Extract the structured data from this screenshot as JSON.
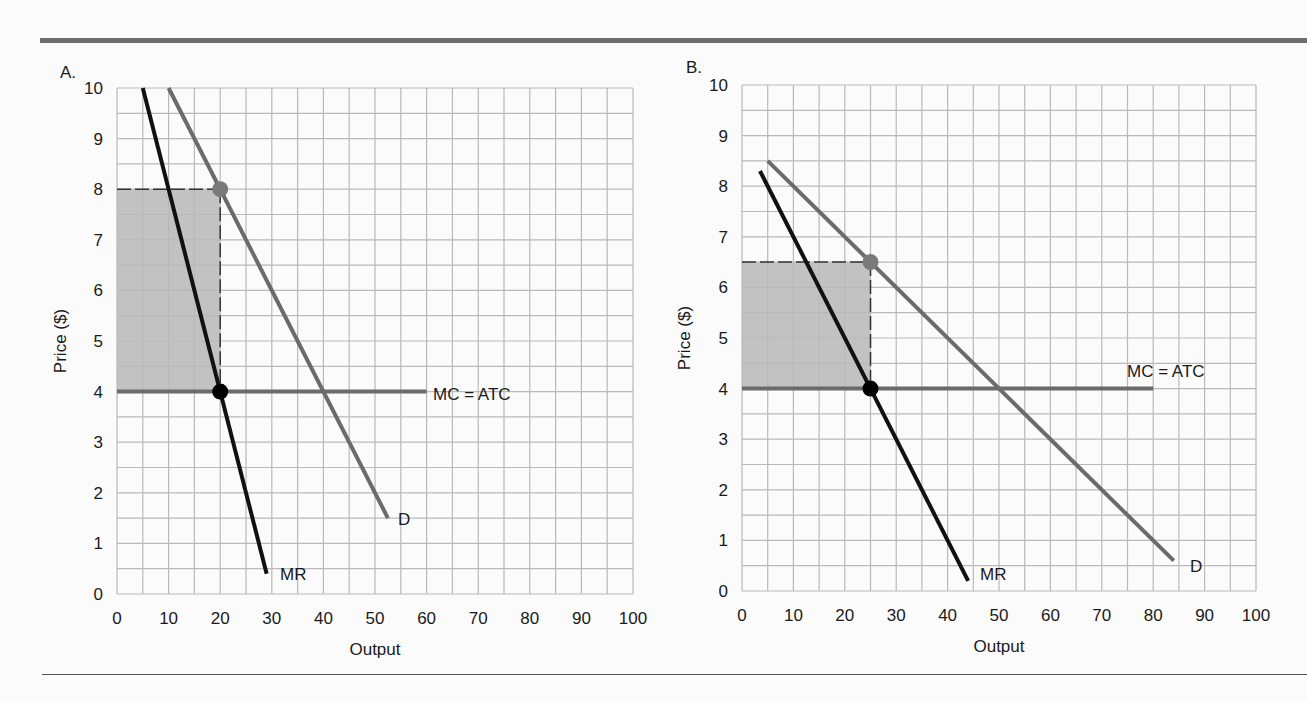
{
  "chart_data": [
    {
      "panel": "A.",
      "type": "line",
      "xlabel": "Output",
      "ylabel": "Price ($)",
      "xlim": [
        0,
        100
      ],
      "ylim": [
        0,
        10
      ],
      "x_ticks": [
        "0",
        "10",
        "20",
        "30",
        "40",
        "50",
        "60",
        "70",
        "80",
        "90",
        "100"
      ],
      "y_ticks": [
        "0",
        "1",
        "2",
        "3",
        "4",
        "5",
        "6",
        "7",
        "8",
        "9",
        "10"
      ],
      "grid": true,
      "series": [
        {
          "name": "D",
          "color": "#6b6b6b",
          "points": [
            [
              10,
              10
            ],
            [
              52.5,
              1.5
            ]
          ]
        },
        {
          "name": "MR",
          "color": "#111111",
          "points": [
            [
              5,
              10
            ],
            [
              29,
              0.4
            ]
          ]
        },
        {
          "name": "MC = ATC",
          "color": "#6b6b6b",
          "points": [
            [
              0,
              4
            ],
            [
              60,
              4
            ]
          ]
        }
      ],
      "markers": [
        {
          "label": "demand point",
          "x": 20,
          "y": 8,
          "color": "#7a7a7a"
        },
        {
          "label": "MR=MC point",
          "x": 20,
          "y": 4,
          "color": "#000000"
        }
      ],
      "shaded_region": {
        "x": [
          0,
          20
        ],
        "y": [
          4,
          8
        ],
        "color": "#c2c2c2"
      },
      "labels": {
        "D": "D",
        "MR": "MR",
        "MC": "MC = ATC"
      }
    },
    {
      "panel": "B.",
      "type": "line",
      "xlabel": "Output",
      "ylabel": "Price ($)",
      "xlim": [
        0,
        100
      ],
      "ylim": [
        0,
        10
      ],
      "x_ticks": [
        "0",
        "10",
        "20",
        "30",
        "40",
        "50",
        "60",
        "70",
        "80",
        "90",
        "100"
      ],
      "y_ticks": [
        "0",
        "1",
        "2",
        "3",
        "4",
        "5",
        "6",
        "7",
        "8",
        "9",
        "10"
      ],
      "grid": true,
      "series": [
        {
          "name": "D",
          "color": "#6b6b6b",
          "points": [
            [
              5,
              8.5
            ],
            [
              84,
              0.6
            ]
          ]
        },
        {
          "name": "MR",
          "color": "#111111",
          "points": [
            [
              3.5,
              8.3
            ],
            [
              44,
              0.2
            ]
          ]
        },
        {
          "name": "MC = ATC",
          "color": "#6b6b6b",
          "points": [
            [
              0,
              4
            ],
            [
              80,
              4
            ]
          ]
        }
      ],
      "markers": [
        {
          "label": "demand point",
          "x": 25,
          "y": 6.5,
          "color": "#7a7a7a"
        },
        {
          "label": "MR=MC point",
          "x": 25,
          "y": 4,
          "color": "#000000"
        }
      ],
      "shaded_region": {
        "x": [
          0,
          25
        ],
        "y": [
          4,
          6.5
        ],
        "color": "#c2c2c2"
      },
      "labels": {
        "D": "D",
        "MR": "MR",
        "MC": "MC = ATC"
      }
    }
  ]
}
